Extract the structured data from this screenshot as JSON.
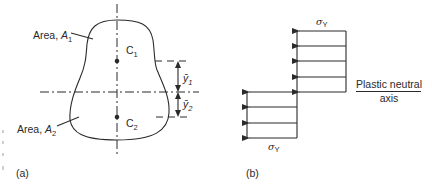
{
  "figure_a": {
    "panel_label": "(a)",
    "area1_label": "Area, ",
    "area1_symbol": "A",
    "area1_sub": "1",
    "area2_label": "Area, ",
    "area2_symbol": "A",
    "area2_sub": "2",
    "centroid1_symbol": "C",
    "centroid1_sub": "1",
    "centroid2_symbol": "C",
    "centroid2_sub": "2",
    "ybar1_symbol": "ȳ",
    "ybar1_sub": "1",
    "ybar2_symbol": "ȳ",
    "ybar2_sub": "2"
  },
  "figure_b": {
    "panel_label": "(b)",
    "stress_top_symbol": "σ",
    "stress_top_sub": "Y",
    "stress_bottom_symbol": "σ",
    "stress_bottom_sub": "Y",
    "axis_label_line1": "Plastic neutral",
    "axis_label_line2": "axis",
    "arrows_top_count": 5,
    "arrows_bottom_count": 4
  },
  "colors": {
    "ink": "#2a2a2a",
    "background": "#ffffff"
  }
}
